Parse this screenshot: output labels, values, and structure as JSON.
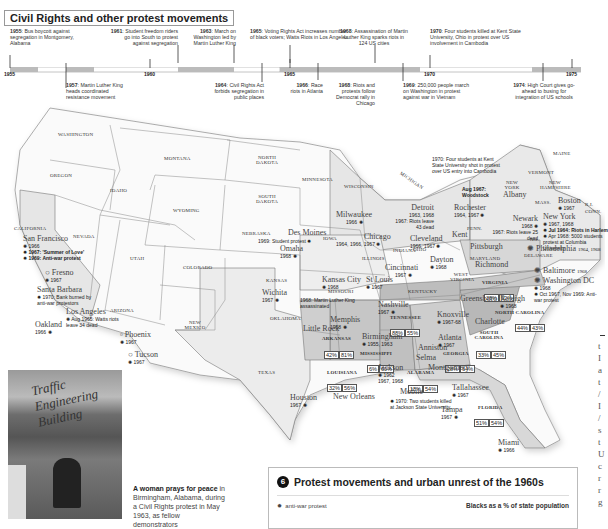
{
  "timeline": {
    "title": "Civil Rights and other protest movements",
    "years": [
      "1955",
      "1960",
      "1965",
      "1970",
      "1975"
    ],
    "events_above": [
      {
        "year": "1955",
        "text": "Bus boycott against segregation in Montgomery, Alabama"
      },
      {
        "year": "1961",
        "text": "Student freedom riders go into South to protest against segregation"
      },
      {
        "year": "1963",
        "text": "March on Washington led by Martin Luther King"
      },
      {
        "year": "1965",
        "text": "Voting Rights Act increases number of black voters; Watts Riots in Los Angeles"
      },
      {
        "year": "1968",
        "text": "Assassination of Martin Luther King sparks riots in 124 US cities"
      },
      {
        "year": "1970",
        "text": "Four students killed at Kent State University, Ohio in protest over US involvement in Cambodia"
      }
    ],
    "events_below": [
      {
        "year": "1957",
        "text": "Martin Luther King heads coordinated resistance movement"
      },
      {
        "year": "1964",
        "text": "Civil Rights Act forbids segregation in public places"
      },
      {
        "year": "1966",
        "text": "Race riots in Atlanta"
      },
      {
        "year": "1968",
        "text": "Riots and protests follow Democrat rally in Chicago"
      },
      {
        "year": "1969",
        "text": "250,000 people march on Washington in protest against war in Vietnam"
      },
      {
        "year": "1974",
        "text": "High Court gives go-ahead to busing for integration of US schools"
      }
    ]
  },
  "map": {
    "states": [
      "WASHINGTON",
      "OREGON",
      "CALIFORNIA",
      "IDAHO",
      "NEVADA",
      "MONTANA",
      "WYOMING",
      "UTAH",
      "ARIZONA",
      "COLORADO",
      "NEW MEXICO",
      "NORTH DAKOTA",
      "SOUTH DAKOTA",
      "NEBRASKA",
      "KANSAS",
      "OKLAHOMA",
      "TEXAS",
      "MINNESOTA",
      "IOWA",
      "MISSOURI",
      "WISCONSIN",
      "ILLINOIS",
      "MICHIGAN",
      "INDIANA",
      "OHIO",
      "KENTUCKY",
      "TENNESSEE",
      "ARKANSAS",
      "LOUISIANA",
      "MISSISSIPPI",
      "ALABAMA",
      "GEORGIA",
      "FLORIDA",
      "SOUTH CAROLINA",
      "NORTH CAROLINA",
      "VIRGINIA",
      "WEST VIRGINIA",
      "PENN.",
      "NEW YORK",
      "MARYLAND",
      "DELAWARE",
      "N.J.",
      "MAINE",
      "VERMONT",
      "NEW HAMPSHIRE",
      "MASS.",
      "CONN.",
      "R.I."
    ],
    "percentages": [
      {
        "state": "TENNESSEE",
        "a": "88%",
        "b": "55%"
      },
      {
        "state": "ARKANSAS",
        "a": "42%",
        "b": "81%"
      },
      {
        "state": "MISSISSIPPI",
        "a": "6%",
        "b": "60%"
      },
      {
        "state": "LOUISIANA",
        "a": "32%",
        "b": "56%"
      },
      {
        "state": "ALABAMA",
        "a": "18%",
        "b": "54%"
      },
      {
        "state": "GEORGIA",
        "a": "28%",
        "b": "64%"
      },
      {
        "state": "FLORIDA",
        "a": "51%",
        "b": "54%"
      },
      {
        "state": "SOUTH CAROLINA",
        "a": "33%",
        "b": "45%"
      },
      {
        "state": "NORTH CAROLINA",
        "a": "44%",
        "b": "43%"
      },
      {
        "state": "VIRGINIA",
        "a": "38%",
        "b": "52%"
      }
    ],
    "cities": {
      "san_francisco": {
        "name": "San Francisco",
        "events": [
          "1966",
          "1967: 'Summer of Love'",
          "1969: Anti-war protest"
        ]
      },
      "fresno": {
        "name": "Fresno",
        "events": [
          "1967"
        ]
      },
      "santa_barbara": {
        "name": "Santa Barbara",
        "events": [
          "1970: Bank burned by anti-war protestors"
        ]
      },
      "los_angeles": {
        "name": "Los Angeles",
        "events": [
          "Aug 1965: Watts riots leave 34 dead"
        ]
      },
      "oakland": {
        "name": "Oakland",
        "events": [
          "1966"
        ]
      },
      "phoenix": {
        "name": "Phoenix",
        "events": [
          "1967"
        ]
      },
      "tucson": {
        "name": "Tucson",
        "events": [
          "1967"
        ]
      },
      "des_moines": {
        "name": "Des Moines",
        "events": [
          "1969: Student protest"
        ]
      },
      "omaha": {
        "name": "Omaha",
        "events": [
          "1968"
        ]
      },
      "wichita": {
        "name": "Wichita",
        "events": [
          "1967"
        ]
      },
      "kansas_city": {
        "name": "Kansas City",
        "events": [
          "1968"
        ]
      },
      "kansas_city_note": "1968: Martin Luther King assassinated",
      "st_louis": {
        "name": "St Louis",
        "events": [
          "1967"
        ]
      },
      "chicago": {
        "name": "Chicago",
        "events": [
          "1964, 1966, 1967"
        ]
      },
      "milwaukee": {
        "name": "Milwaukee",
        "events": [
          "1966"
        ]
      },
      "detroit": {
        "name": "Detroit",
        "events": [
          "1963, 1968",
          "1967: Riots leave 43 dead"
        ]
      },
      "cleveland": {
        "name": "Cleveland",
        "events": [
          "1966, 1967"
        ]
      },
      "kent": {
        "name": "Kent",
        "events": [
          "1970: Four students at Kent State University shot in protest over US entry into Cambodia"
        ]
      },
      "cincinnati": {
        "name": "Cincinnati",
        "events": [
          "1967"
        ]
      },
      "dayton": {
        "name": "Dayton",
        "events": [
          "1968"
        ]
      },
      "rochester": {
        "name": "Rochester",
        "events": [
          "1964, 1967"
        ]
      },
      "woodstock": {
        "name": "Woodstock",
        "events": [
          "Aug 1967: Woodstock"
        ]
      },
      "albany": {
        "name": "Albany",
        "events": []
      },
      "newark": {
        "name": "Newark",
        "events": [
          "1968",
          "1967: Riots leave 25 dead"
        ]
      },
      "pittsburgh": {
        "name": "Pittsburgh",
        "events": [
          "1968"
        ]
      },
      "boston": {
        "name": "Boston",
        "events": [
          "1967"
        ]
      },
      "new_york": {
        "name": "New York",
        "events": [
          "1967, 1968",
          "Jul 1964: Riots in Harlem",
          "Apr 1968: 5000 students protest at Columbia University"
        ]
      },
      "philadelphia": {
        "name": "Philadelphia",
        "events": [
          "1964, 1968"
        ]
      },
      "baltimore": {
        "name": "Baltimore",
        "events": [
          "1968"
        ]
      },
      "washington_dc": {
        "name": "Washington DC",
        "events": [
          "1968",
          "Oct 1967, Nov 1969: Anti-war protest"
        ]
      },
      "richmond": {
        "name": "Richmond",
        "events": [
          "1968"
        ]
      },
      "nashville": {
        "name": "Nashville",
        "events": [
          "1967"
        ]
      },
      "memphis": {
        "name": "Memphis",
        "events": [
          "1968"
        ]
      },
      "little_rock": {
        "name": "Little Rock",
        "events": []
      },
      "knoxville": {
        "name": "Knoxville",
        "events": [
          "1967-68"
        ]
      },
      "greensboro": {
        "name": "Greensboro",
        "events": [
          "1968"
        ]
      },
      "raleigh": {
        "name": "Raleigh",
        "events": [
          "1968"
        ]
      },
      "charlotte": {
        "name": "Charlotte",
        "events": [
          "1968"
        ]
      },
      "atlanta": {
        "name": "Atlanta",
        "events": [
          "1967"
        ]
      },
      "anniston": {
        "name": "Anniston",
        "events": []
      },
      "birmingham": {
        "name": "Birmingham",
        "events": [
          "1955, 1963"
        ]
      },
      "selma": {
        "name": "Selma",
        "events": []
      },
      "montgomery": {
        "name": "Montgomery",
        "events": []
      },
      "jackson": {
        "name": "Jackson",
        "events": [
          "1962",
          "1967, 1968"
        ]
      },
      "jackson_note": "1970: Two students killed at Jackson State University",
      "mobile": {
        "name": "Mobile",
        "events": []
      },
      "new_orleans": {
        "name": "New Orleans",
        "events": []
      },
      "houston": {
        "name": "Houston",
        "events": [
          "1967"
        ]
      },
      "tallahassee": {
        "name": "Tallahassee",
        "events": [
          "1967"
        ]
      },
      "tampa": {
        "name": "Tampa",
        "events": [
          "1967"
        ]
      },
      "miami": {
        "name": "Miami",
        "events": [
          "1966"
        ]
      }
    }
  },
  "photo_caption": {
    "bold": "A woman prays for peace",
    "text": " in Birmingham, Alabama, during a Civil Rights protest in May 1963, as fellow demonstrators"
  },
  "photo_sign": "Traffic Engineering Building",
  "legend": {
    "number": "6",
    "title": "Protest movements and urban unrest of the 1960s",
    "items": [
      {
        "icon": "anti-war-protest-icon",
        "label": "anti-war protest"
      }
    ],
    "right_heading": "Blacks as a % of state population"
  },
  "edge_letters": [
    "t",
    "I",
    "a",
    "t",
    "/",
    "I",
    "/",
    "s",
    "t",
    "U",
    "c",
    "r",
    "r",
    "g",
    "i"
  ]
}
